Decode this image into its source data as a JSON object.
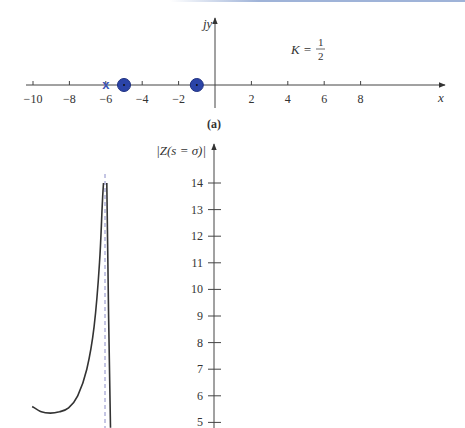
{
  "chart_data": [
    {
      "type": "scatter",
      "panel_label": "(a)",
      "title": "",
      "xlabel": "x",
      "ylabel": "jy",
      "annotation": {
        "text": "K = 1/2",
        "numerator": "1",
        "denominator": "2",
        "prefix": "K ="
      },
      "x_ticks": [
        -10,
        -8,
        -6,
        -4,
        -2,
        2,
        4,
        6,
        8
      ],
      "x_tick_labels": [
        "−10",
        "−8",
        "−6",
        "−4",
        "−2",
        "2",
        "4",
        "6",
        "8"
      ],
      "xlim": [
        -10.5,
        12.5
      ],
      "grid": false,
      "markers": [
        {
          "kind": "pole",
          "symbol": "x",
          "x": -6,
          "y": 0,
          "color": "#3c55b5"
        },
        {
          "kind": "zero",
          "symbol": "circle-dot",
          "x": -5,
          "y": 0,
          "color": "#2b44a8"
        },
        {
          "kind": "zero",
          "symbol": "circle-dot",
          "x": -1,
          "y": 0,
          "color": "#2b44a8"
        }
      ]
    },
    {
      "type": "line",
      "ylabel": "|Z(s = σ)|",
      "y_ticks": [
        5,
        6,
        7,
        8,
        9,
        10,
        11,
        12,
        13,
        14
      ],
      "y_tick_labels": [
        "5",
        "6",
        "7",
        "8",
        "9",
        "10",
        "11",
        "12",
        "13",
        "14"
      ],
      "ylim": [
        4.8,
        15.5
      ],
      "grid": false,
      "asymptote": {
        "x": -6,
        "style": "dashed",
        "color": "#7d7fc4"
      },
      "series": [
        {
          "name": "left branch",
          "x": [
            -10,
            -9.5,
            -9,
            -8.5,
            -8,
            -7.5,
            -7,
            -6.6,
            -6.3,
            -6.15,
            -6.08
          ],
          "values": [
            5.6,
            5.4,
            5.35,
            5.4,
            5.55,
            6.0,
            7.0,
            8.6,
            11.0,
            13.2,
            14.0
          ]
        },
        {
          "name": "right branch",
          "x": [
            -5.9,
            -5.8,
            -5.7
          ],
          "values": [
            14.0,
            9.0,
            4.8
          ]
        }
      ]
    }
  ],
  "labels": {
    "top_y": "jy",
    "top_x": "x",
    "k_prefix": "K =",
    "k_num": "1",
    "k_den": "2",
    "panel_a": "(a)",
    "bottom_y": "|Z(s = σ)|"
  }
}
